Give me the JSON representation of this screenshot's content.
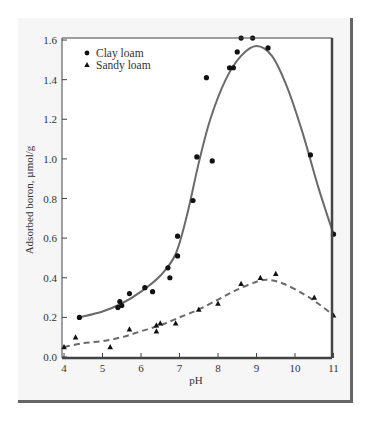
{
  "chart_data": {
    "type": "scatter",
    "title": "",
    "xlabel": "pH",
    "ylabel": "Adsorbed boron, µmol/g",
    "xlim": [
      4,
      11
    ],
    "ylim": [
      0.0,
      1.6
    ],
    "x_ticks": [
      "4",
      "5",
      "6",
      "7",
      "8",
      "9",
      "10",
      "11"
    ],
    "y_ticks": [
      "0.0",
      "0.2",
      "0.4",
      "0.6",
      "0.8",
      "1.0",
      "1.2",
      "1.4",
      "1.6"
    ],
    "grid": false,
    "legend_position": "upper left",
    "series": [
      {
        "name": "Clay loam",
        "marker": "circle",
        "fit_line": "solid",
        "points": [
          [
            4.4,
            0.2
          ],
          [
            5.4,
            0.25
          ],
          [
            5.45,
            0.28
          ],
          [
            5.5,
            0.26
          ],
          [
            5.7,
            0.32
          ],
          [
            6.1,
            0.35
          ],
          [
            6.3,
            0.33
          ],
          [
            6.7,
            0.45
          ],
          [
            6.75,
            0.4
          ],
          [
            6.95,
            0.61
          ],
          [
            6.95,
            0.51
          ],
          [
            7.35,
            0.79
          ],
          [
            7.45,
            1.01
          ],
          [
            7.7,
            1.41
          ],
          [
            7.85,
            0.99
          ],
          [
            8.3,
            1.46
          ],
          [
            8.4,
            1.46
          ],
          [
            8.5,
            1.54
          ],
          [
            8.6,
            1.61
          ],
          [
            8.9,
            1.61
          ],
          [
            9.3,
            1.56
          ],
          [
            10.4,
            1.02
          ],
          [
            11.0,
            0.62
          ]
        ],
        "curve": [
          [
            4.4,
            0.2
          ],
          [
            5.0,
            0.23
          ],
          [
            5.5,
            0.27
          ],
          [
            6.0,
            0.33
          ],
          [
            6.5,
            0.41
          ],
          [
            6.9,
            0.52
          ],
          [
            7.2,
            0.72
          ],
          [
            7.5,
            0.98
          ],
          [
            7.8,
            1.2
          ],
          [
            8.2,
            1.4
          ],
          [
            8.6,
            1.52
          ],
          [
            9.0,
            1.57
          ],
          [
            9.4,
            1.52
          ],
          [
            9.8,
            1.36
          ],
          [
            10.2,
            1.13
          ],
          [
            10.6,
            0.86
          ],
          [
            11.0,
            0.62
          ]
        ]
      },
      {
        "name": "Sandy loam",
        "marker": "triangle",
        "fit_line": "dashed",
        "points": [
          [
            4.0,
            0.05
          ],
          [
            4.3,
            0.1
          ],
          [
            5.2,
            0.05
          ],
          [
            5.7,
            0.14
          ],
          [
            6.4,
            0.16
          ],
          [
            6.4,
            0.13
          ],
          [
            6.5,
            0.17
          ],
          [
            6.9,
            0.17
          ],
          [
            7.5,
            0.24
          ],
          [
            8.0,
            0.27
          ],
          [
            8.6,
            0.37
          ],
          [
            9.1,
            0.4
          ],
          [
            9.5,
            0.42
          ],
          [
            10.5,
            0.3
          ],
          [
            11.0,
            0.21
          ]
        ],
        "curve": [
          [
            4.0,
            0.05
          ],
          [
            4.5,
            0.07
          ],
          [
            5.0,
            0.08
          ],
          [
            5.5,
            0.1
          ],
          [
            6.0,
            0.13
          ],
          [
            6.5,
            0.16
          ],
          [
            7.0,
            0.2
          ],
          [
            7.5,
            0.24
          ],
          [
            8.0,
            0.29
          ],
          [
            8.5,
            0.34
          ],
          [
            9.0,
            0.38
          ],
          [
            9.3,
            0.39
          ],
          [
            9.7,
            0.37
          ],
          [
            10.2,
            0.32
          ],
          [
            10.6,
            0.27
          ],
          [
            11.0,
            0.21
          ]
        ]
      }
    ]
  },
  "legend": {
    "items": [
      {
        "label": "Clay loam",
        "marker": "circle"
      },
      {
        "label": "Sandy loam",
        "marker": "triangle"
      }
    ]
  },
  "axes": {
    "x_label": "pH",
    "y_label": "Adsorbed boron, µmol/g"
  },
  "colors": {
    "line": "#6a6a6a",
    "marker": "#111111",
    "frame": "#444444",
    "card_bg": "#f6f6f6",
    "card_shadow": "#666666"
  }
}
